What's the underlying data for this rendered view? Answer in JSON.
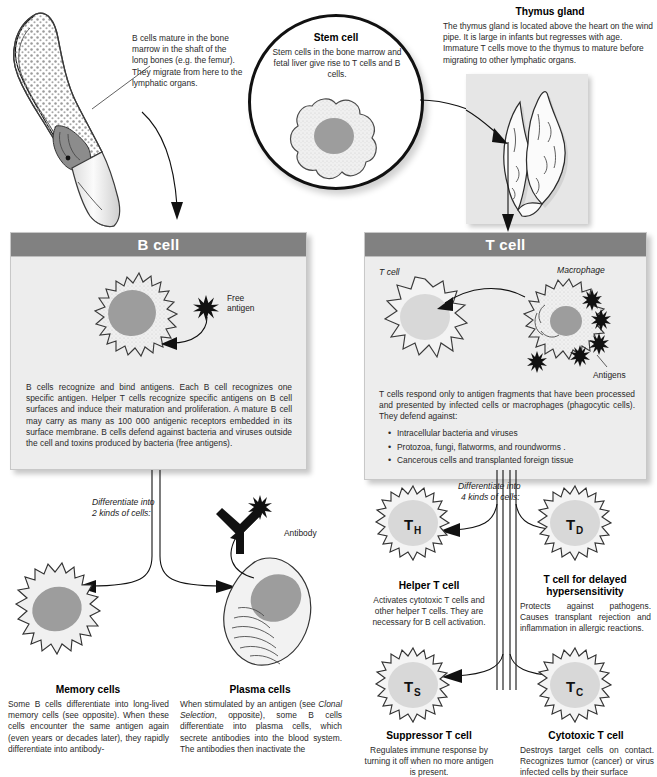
{
  "page": {
    "faint_top_text": "",
    "accent_header_bg": "#818181",
    "panel_bg": "#ededed",
    "nucleus_color": "#9d9d9d"
  },
  "bone_marrow": {
    "caption": "B cells mature in the bone marrow in the shaft of the long bones (e.g. the femur). They migrate from here to the lymphatic organs.",
    "image_name": "bone-marrow-illustration"
  },
  "stem_cell": {
    "title": "Stem cell",
    "description": "Stem cells in the bone marrow and fetal liver give rise to T cells and B cells.",
    "image_name": "stem-cell-illustration"
  },
  "thymus": {
    "title": "Thymus gland",
    "description": "The thymus gland is located above the heart on the wind pipe. It is large in infants but regresses with age. Immature T cells move to the thymus to mature before migrating to other lymphatic organs.",
    "image_name": "thymus-gland-photo"
  },
  "b_cell_panel": {
    "header": "B cell",
    "antigen_label": "Free\nantigen",
    "antigen_label_line1": "Free",
    "antigen_label_line2": "antigen",
    "body": "B cells recognize and bind antigens. Each B cell recognizes one specific antigen. Helper T cells recognize specific antigens on B cell surfaces and induce their maturation and proliferation. A mature B cell may carry as many as 100 000 antigenic receptors embedded in its surface membrane. B cells defend against bacteria and viruses outside the cell and toxins produced by bacteria (free antigens)."
  },
  "t_cell_panel": {
    "header": "T cell",
    "tcell_label": "T cell",
    "macrophage_label": "Macrophage",
    "antigens_label": "Antigens",
    "body": "T cells respond only to antigen fragments that have been processed and presented by infected cells or macrophages (phagocytic cells). They defend against:",
    "bullets": [
      "Intracellular bacteria and viruses",
      "Protozoa, fungi, flatworms, and roundworms .",
      "Cancerous cells and transplanted foreign tissue"
    ]
  },
  "b_branch": {
    "differentiate_line1": "Differentiate into",
    "differentiate_line2": "2 kinds of cells:",
    "antibody_label": "Antibody"
  },
  "t_branch": {
    "differentiate_line1": "Differentiate into",
    "differentiate_line2": "4 kinds of cells:"
  },
  "memory_cells": {
    "title": "Memory cells",
    "body": "Some B cells differentiate into long-lived memory cells (see opposite). When these cells encounter the same antigen again (even years or decades later), they rapidly differentiate into antibody-"
  },
  "plasma_cells": {
    "title": "Plasma cells",
    "body_part1": "When stimulated by an antigen (see ",
    "body_italic": "Clonal Selection",
    "body_part2": ", opposite), some B cells differentiate into plasma cells, which secrete antibodies into the blood system. The antibodies then inactivate the"
  },
  "helper_t": {
    "symbol": "T",
    "subscript": "H",
    "title": "Helper T cell",
    "body": "Activates cytotoxic T cells and other helper T cells. They are necessary for B cell activation."
  },
  "delayed_t": {
    "symbol": "T",
    "subscript": "D",
    "title_line1": "T cell for delayed",
    "title_line2": "hypersensitivity",
    "body": "Protects against pathogens. Causes transplant rejection and inflammation in allergic reactions."
  },
  "suppressor_t": {
    "symbol": "T",
    "subscript": "S",
    "title": "Suppressor T cell",
    "body": "Regulates immune response by turning it off when no more antigen is present."
  },
  "cytotoxic_t": {
    "symbol": "T",
    "subscript": "C",
    "title": "Cytotoxic T cell",
    "body": "Destroys target cells on contact. Recognizes tumor (cancer) or virus infected cells by their surface"
  }
}
